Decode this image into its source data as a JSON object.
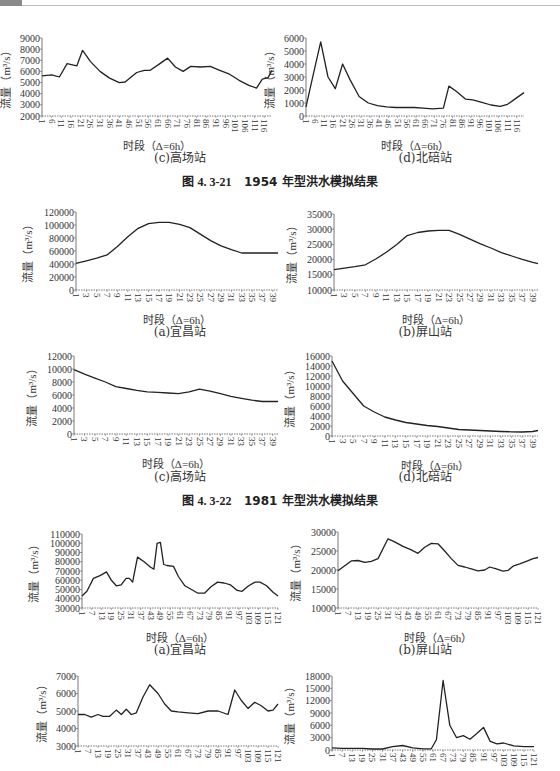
{
  "page": {
    "figure_captions": [
      {
        "id": "fig-4.3-21",
        "label": "图 4. 3-21",
        "text": "1954 年型洪水模拟结果"
      },
      {
        "id": "fig-4.3-22",
        "label": "图 4. 3-22",
        "text": "1981 年型洪水模拟结果"
      }
    ],
    "axis": {
      "ylabel": "流量（m³/s）",
      "xlabel": "时段（Δ=6h）"
    }
  },
  "chart_data": [
    {
      "id": "fig21c",
      "figure": "图 4.3-21 1954 年型",
      "type": "line",
      "title": "(c)高场站",
      "xlabel": "时段（Δ=6h）",
      "ylabel": "流量（m³/s）",
      "ylim": [
        2000,
        9000
      ],
      "yticks": [
        2000,
        3000,
        4000,
        5000,
        6000,
        7000,
        8000,
        9000
      ],
      "xticks": [
        1,
        6,
        11,
        16,
        21,
        26,
        31,
        36,
        41,
        46,
        51,
        56,
        61,
        66,
        71,
        76,
        81,
        86,
        91,
        96,
        101,
        106,
        111,
        116
      ],
      "xmax": 120,
      "grid": false,
      "x": [
        1,
        6,
        10,
        14,
        19,
        22,
        26,
        31,
        36,
        41,
        44,
        50,
        54,
        57,
        62,
        66,
        70,
        74,
        78,
        83,
        88,
        93,
        98,
        103,
        108,
        112,
        115,
        118,
        120
      ],
      "values": [
        5600,
        5700,
        5500,
        6700,
        6500,
        7900,
        6900,
        6000,
        5400,
        5000,
        5050,
        5900,
        6100,
        6100,
        6700,
        7200,
        6400,
        6000,
        6450,
        6400,
        6450,
        6100,
        5750,
        5200,
        4750,
        4500,
        5300,
        5450,
        6100
      ]
    },
    {
      "id": "fig21d",
      "figure": "图 4.3-21 1954 年型",
      "type": "line",
      "title": "(d)北碚站",
      "xlabel": "时段（Δ=6h）",
      "ylabel": "流量（m³/s）",
      "ylim": [
        0,
        6000
      ],
      "yticks": [
        0,
        1000,
        2000,
        3000,
        4000,
        5000,
        6000
      ],
      "xticks": [
        1,
        6,
        11,
        16,
        21,
        26,
        31,
        36,
        41,
        46,
        51,
        56,
        61,
        66,
        71,
        76,
        81,
        86,
        91,
        96,
        101,
        106,
        111,
        116
      ],
      "xmax": 120,
      "grid": false,
      "x": [
        1,
        5,
        9,
        13,
        17,
        21,
        25,
        30,
        35,
        40,
        45,
        50,
        55,
        60,
        65,
        70,
        76,
        79,
        83,
        88,
        92,
        97,
        102,
        107,
        111,
        115,
        120
      ],
      "values": [
        700,
        3200,
        5700,
        3000,
        2100,
        4000,
        2800,
        1500,
        1000,
        800,
        700,
        650,
        650,
        650,
        600,
        550,
        600,
        2300,
        1900,
        1300,
        1250,
        1050,
        850,
        750,
        900,
        1300,
        1800
      ]
    },
    {
      "id": "fig22a",
      "figure": "图 4.3-22 1981 年型",
      "type": "line",
      "title": "(a)宜昌站",
      "xlabel": "时段（Δ=6h）",
      "ylabel": "流量（m³/s）",
      "ylim": [
        0,
        120000
      ],
      "yticks": [
        0,
        20000,
        40000,
        60000,
        80000,
        100000,
        120000
      ],
      "xticks": [
        1,
        3,
        5,
        7,
        9,
        11,
        13,
        15,
        17,
        19,
        21,
        23,
        25,
        27,
        29,
        31,
        33,
        35,
        37,
        39
      ],
      "xmax": 40,
      "grid": false,
      "x": [
        1,
        3,
        5,
        7,
        9,
        11,
        13,
        15,
        17,
        19,
        21,
        23,
        25,
        27,
        29,
        31,
        33,
        35,
        37,
        39,
        40
      ],
      "values": [
        41000,
        45000,
        49000,
        54000,
        67000,
        82000,
        95000,
        102000,
        104000,
        104000,
        101000,
        96000,
        86000,
        76000,
        68000,
        62000,
        57000,
        57000,
        57000,
        57000,
        57000
      ]
    },
    {
      "id": "fig22b",
      "figure": "图 4.3-22 1981 年型",
      "type": "line",
      "title": "(b)屏山站",
      "xlabel": "时段（Δ=6h）",
      "ylabel": "流量（m³/s）",
      "ylim": [
        10000,
        35000
      ],
      "yticks": [
        10000,
        15000,
        20000,
        25000,
        30000,
        35000
      ],
      "xticks": [
        1,
        3,
        5,
        7,
        9,
        11,
        13,
        15,
        17,
        19,
        21,
        23,
        25,
        27,
        29,
        31,
        33,
        35,
        37,
        39
      ],
      "xmax": 40,
      "grid": false,
      "x": [
        1,
        3,
        5,
        7,
        9,
        11,
        13,
        15,
        17,
        19,
        21,
        23,
        25,
        27,
        29,
        31,
        33,
        35,
        37,
        39,
        40
      ],
      "values": [
        16700,
        17200,
        17700,
        18300,
        20200,
        22400,
        25000,
        27900,
        28900,
        29400,
        29600,
        29600,
        28300,
        26700,
        25200,
        23800,
        22300,
        21200,
        20100,
        19100,
        18700
      ]
    },
    {
      "id": "fig22c",
      "figure": "图 4.3-22 1981 年型",
      "type": "line",
      "title": "(c)高场站",
      "xlabel": "时段（Δ=6h）",
      "ylabel": "流量（m³/s）",
      "ylim": [
        0,
        12000
      ],
      "yticks": [
        0,
        2000,
        4000,
        6000,
        8000,
        10000,
        12000
      ],
      "xticks": [
        1,
        3,
        5,
        7,
        9,
        11,
        13,
        15,
        17,
        19,
        21,
        23,
        25,
        27,
        29,
        31,
        33,
        35,
        37,
        39
      ],
      "xmax": 40,
      "grid": false,
      "x": [
        1,
        3,
        5,
        7,
        9,
        11,
        13,
        15,
        17,
        19,
        21,
        23,
        25,
        27,
        29,
        31,
        33,
        35,
        37,
        39,
        40
      ],
      "values": [
        9900,
        9200,
        8600,
        8000,
        7300,
        7000,
        6700,
        6500,
        6400,
        6300,
        6200,
        6500,
        6900,
        6600,
        6200,
        5800,
        5500,
        5200,
        5000,
        5000,
        5000
      ]
    },
    {
      "id": "fig22d",
      "figure": "图 4.3-22 1981 年型",
      "type": "line",
      "title": "(d)北碚站",
      "xlabel": "时段（Δ=6h）",
      "ylabel": "流量（m³/s）",
      "ylim": [
        0,
        16000
      ],
      "yticks": [
        0,
        2000,
        4000,
        6000,
        8000,
        10000,
        12000,
        14000,
        16000
      ],
      "xticks": [
        1,
        3,
        5,
        7,
        9,
        11,
        13,
        15,
        17,
        19,
        21,
        23,
        25,
        27,
        29,
        31,
        33,
        35,
        37,
        39
      ],
      "xmax": 40,
      "grid": false,
      "x": [
        1,
        3,
        5,
        7,
        9,
        11,
        13,
        15,
        17,
        19,
        21,
        23,
        25,
        27,
        29,
        31,
        33,
        35,
        37,
        39,
        40
      ],
      "values": [
        15000,
        11000,
        8500,
        6000,
        4800,
        3800,
        3200,
        2700,
        2400,
        2100,
        1900,
        1600,
        1300,
        1200,
        1100,
        1000,
        900,
        850,
        800,
        900,
        1100
      ]
    },
    {
      "id": "fig23a",
      "figure": "(next figure)",
      "type": "line",
      "title": "(a)宜昌站",
      "xlabel": "时段（Δ=6h）",
      "ylabel": "流量（m³/s）",
      "ylim": [
        30000,
        110000
      ],
      "yticks": [
        30000,
        40000,
        50000,
        60000,
        70000,
        80000,
        90000,
        100000,
        110000
      ],
      "xticks": [
        1,
        7,
        13,
        19,
        25,
        31,
        37,
        43,
        49,
        55,
        61,
        67,
        73,
        79,
        85,
        91,
        97,
        103,
        109,
        115,
        121
      ],
      "xmax": 121,
      "grid": false,
      "x": [
        1,
        4,
        8,
        12,
        16,
        19,
        22,
        25,
        28,
        30,
        32,
        35,
        39,
        43,
        45,
        47,
        49,
        51,
        53,
        57,
        60,
        64,
        68,
        72,
        76,
        80,
        84,
        88,
        92,
        96,
        99,
        103,
        107,
        110,
        114,
        118,
        121
      ],
      "values": [
        43000,
        48000,
        62000,
        65000,
        69000,
        60000,
        54000,
        55000,
        62000,
        62000,
        58000,
        85000,
        80000,
        74000,
        72000,
        100000,
        101000,
        77000,
        76000,
        75000,
        64000,
        54000,
        50000,
        46000,
        46000,
        53000,
        58000,
        57000,
        55000,
        49000,
        48000,
        54000,
        58000,
        58000,
        54000,
        47000,
        43000
      ]
    },
    {
      "id": "fig23b",
      "figure": "(next figure)",
      "type": "line",
      "title": "(b)屏山站",
      "xlabel": "时段（Δ=6h）",
      "ylabel": "流量（m³/s）",
      "ylim": [
        10000,
        30000
      ],
      "yticks": [
        10000,
        15000,
        20000,
        25000,
        30000
      ],
      "xticks": [
        1,
        7,
        13,
        19,
        25,
        31,
        37,
        43,
        49,
        55,
        61,
        67,
        73,
        79,
        85,
        91,
        97,
        103,
        109,
        115,
        121
      ],
      "xmax": 121,
      "grid": false,
      "x": [
        1,
        4,
        9,
        13,
        17,
        21,
        25,
        31,
        35,
        40,
        45,
        49,
        53,
        57,
        61,
        65,
        69,
        73,
        77,
        81,
        85,
        89,
        92,
        96,
        100,
        103,
        106,
        110,
        114,
        118,
        121
      ],
      "values": [
        19800,
        20800,
        22400,
        22500,
        22000,
        22300,
        23000,
        28200,
        27400,
        26200,
        25300,
        24400,
        26000,
        27000,
        26900,
        25000,
        23000,
        21200,
        20800,
        20300,
        19800,
        20000,
        20800,
        20300,
        19700,
        19900,
        21000,
        21600,
        22300,
        23000,
        23300
      ]
    },
    {
      "id": "fig23c",
      "figure": "(next figure)",
      "type": "line",
      "title": "(c)高场站",
      "xlabel": "时段（Δ=6h）",
      "ylabel": "流量（m³/s）",
      "ylim": [
        3000,
        7000
      ],
      "yticks": [
        3000,
        4000,
        5000,
        6000,
        7000
      ],
      "xticks": [
        1,
        7,
        13,
        19,
        25,
        31,
        37,
        43,
        49,
        55,
        61,
        67,
        73,
        79,
        85,
        91,
        97,
        103,
        109,
        115,
        121
      ],
      "xmax": 121,
      "grid": false,
      "x": [
        1,
        5,
        9,
        13,
        16,
        20,
        24,
        27,
        30,
        33,
        36,
        40,
        44,
        49,
        53,
        57,
        61,
        67,
        73,
        79,
        85,
        91,
        95,
        99,
        103,
        107,
        111,
        115,
        118,
        121
      ],
      "values": [
        4800,
        4800,
        4650,
        4800,
        4700,
        4700,
        5050,
        4800,
        5100,
        4800,
        4900,
        5800,
        6500,
        6000,
        5400,
        5000,
        4950,
        4900,
        4850,
        5000,
        5000,
        4800,
        6200,
        5600,
        5150,
        5500,
        5300,
        5000,
        5050,
        5400
      ]
    },
    {
      "id": "fig23d",
      "figure": "(next figure)",
      "type": "line",
      "title": "(d)北碚站",
      "xlabel": "时段（Δ=6h）",
      "ylabel": "流量（m³/s）",
      "ylim": [
        0,
        18000
      ],
      "yticks": [
        0,
        3000,
        6000,
        9000,
        12000,
        15000,
        18000
      ],
      "xticks": [
        1,
        7,
        13,
        19,
        25,
        31,
        37,
        43,
        49,
        55,
        61,
        67,
        73,
        79,
        85,
        91,
        97,
        103,
        109,
        115,
        121
      ],
      "xmax": 121,
      "grid": false,
      "x": [
        1,
        7,
        13,
        19,
        25,
        31,
        37,
        43,
        49,
        55,
        60,
        63,
        67,
        71,
        75,
        79,
        83,
        87,
        91,
        95,
        99,
        103,
        109,
        115,
        121
      ],
      "values": [
        500,
        400,
        400,
        400,
        250,
        250,
        800,
        1100,
        500,
        300,
        300,
        2500,
        16900,
        6000,
        3000,
        3500,
        2600,
        4000,
        5500,
        2100,
        1500,
        1700,
        1000,
        800,
        800
      ]
    }
  ]
}
